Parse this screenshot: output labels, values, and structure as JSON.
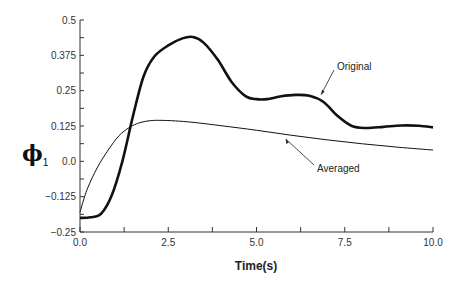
{
  "chart_data": {
    "type": "line",
    "title": "",
    "xlabel": "Time(s)",
    "ylabel": "φ1",
    "ylabel_symbol": "ϕ",
    "ylabel_subscript": "1",
    "xlim": [
      0,
      10
    ],
    "ylim": [
      -0.25,
      0.5
    ],
    "x_ticks": [
      0.0,
      2.5,
      5.0,
      7.5,
      10.0
    ],
    "x_tick_labels": [
      "0.0",
      "2.5",
      "5.0",
      "7.5",
      "10.0"
    ],
    "y_ticks": [
      -0.25,
      -0.125,
      0.0,
      0.125,
      0.25,
      0.375,
      0.5
    ],
    "y_tick_labels": [
      "-0.25",
      "-0.125",
      "0.0",
      "0.125",
      "0.25",
      "0.375",
      "0.5"
    ],
    "grid": false,
    "legend": "annotations",
    "series": [
      {
        "name": "Original",
        "style": "thick",
        "x": [
          0,
          0.3,
          0.6,
          0.9,
          1.2,
          1.5,
          1.8,
          2.1,
          2.5,
          2.9,
          3.2,
          3.5,
          3.9,
          4.3,
          4.7,
          5.0,
          5.3,
          5.7,
          6.1,
          6.5,
          6.9,
          7.3,
          7.7,
          8.1,
          8.6,
          9.1,
          9.6,
          10.0
        ],
        "y": [
          -0.2,
          -0.198,
          -0.185,
          -0.12,
          0.0,
          0.16,
          0.3,
          0.37,
          0.41,
          0.435,
          0.44,
          0.42,
          0.36,
          0.28,
          0.23,
          0.22,
          0.22,
          0.23,
          0.235,
          0.232,
          0.21,
          0.16,
          0.125,
          0.118,
          0.122,
          0.127,
          0.126,
          0.12
        ]
      },
      {
        "name": "Averaged",
        "style": "thin",
        "x": [
          0,
          0.2,
          0.5,
          0.8,
          1.1,
          1.4,
          1.7,
          2.0,
          2.3,
          2.7,
          3.2,
          4.0,
          5.0,
          6.0,
          7.0,
          8.0,
          9.0,
          10.0
        ],
        "y": [
          -0.18,
          -0.1,
          -0.02,
          0.04,
          0.09,
          0.12,
          0.137,
          0.144,
          0.145,
          0.143,
          0.138,
          0.126,
          0.11,
          0.092,
          0.076,
          0.062,
          0.05,
          0.04
        ]
      }
    ],
    "annotations": [
      {
        "text": "Original",
        "points_to_x": 6.8,
        "points_to_y": 0.225
      },
      {
        "text": "Averaged",
        "points_to_x": 5.8,
        "points_to_y": 0.09
      }
    ]
  }
}
